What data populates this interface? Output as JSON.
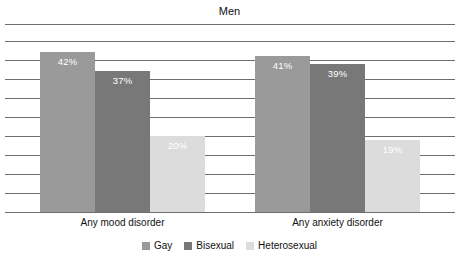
{
  "chart_data": {
    "type": "bar",
    "title": "Men",
    "xlabel": "",
    "ylabel": "",
    "ylim": [
      0,
      45
    ],
    "grid": true,
    "gridline_values": [
      45,
      40,
      35,
      30,
      25,
      20,
      15,
      10,
      5,
      0
    ],
    "legend_position": "bottom",
    "value_suffix": "%",
    "categories": [
      "Any mood disorder",
      "Any anxiety disorder"
    ],
    "series": [
      {
        "name": "Gay",
        "color": "#9a9a9a",
        "values": [
          42,
          41
        ],
        "labels": [
          "42%",
          "41%"
        ]
      },
      {
        "name": "Bisexual",
        "color": "#787878",
        "values": [
          37,
          39
        ],
        "labels": [
          "37%",
          "39%"
        ]
      },
      {
        "name": "Heterosexual",
        "color": "#dcdcdc",
        "values": [
          20,
          19
        ],
        "labels": [
          "20%",
          "19%"
        ]
      }
    ]
  },
  "colors": {
    "gridline": "#6e6e6e",
    "axis": "#6e6e6e",
    "background": "#ffffff",
    "text": "#111111",
    "bar_label_text": "#ffffff"
  }
}
